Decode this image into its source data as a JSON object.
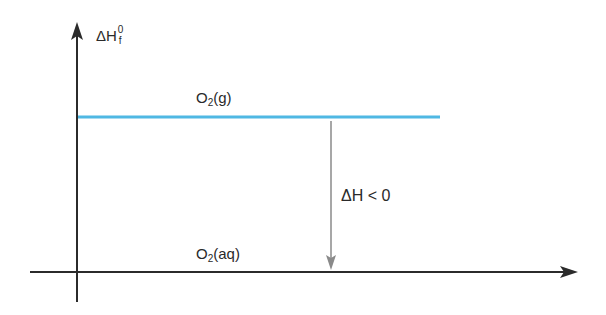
{
  "diagram": {
    "type": "enthalpy-level-diagram",
    "y_axis": {
      "symbol": "ΔH",
      "superscript": "0",
      "subscript": "f"
    },
    "levels": [
      {
        "species": "O",
        "subscript": "2",
        "state": "(g)",
        "color": "#4fb8e3",
        "position": "upper"
      },
      {
        "species": "O",
        "subscript": "2",
        "state": "(aq)",
        "color": "#555555",
        "position": "lower"
      }
    ],
    "transition": {
      "label": "ΔH < 0",
      "direction": "down",
      "color": "#8a8a8a"
    },
    "colors": {
      "axis": "#2b2b2b",
      "upper_level": "#4fb8e3",
      "arrow": "#8a8a8a",
      "text": "#2a2a2a",
      "background": "#ffffff"
    }
  }
}
